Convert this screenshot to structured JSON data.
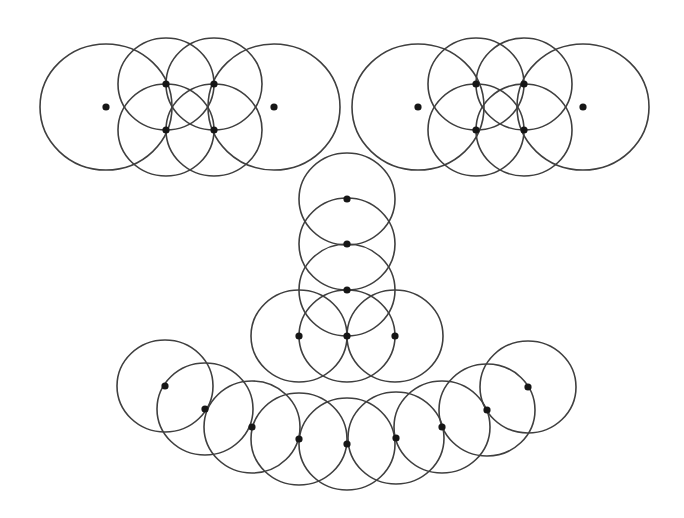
{
  "canvas": {
    "width": 684,
    "height": 518,
    "background": "#ffffff"
  },
  "style": {
    "stroke": "#3f3f3f",
    "dot_fill": "#161616",
    "dot_radius": 3.6
  },
  "groups": [
    {
      "name": "top-left-cluster",
      "circles": [
        {
          "cx": 106,
          "cy": 107,
          "rx": 66,
          "ry": 63,
          "dot": true
        },
        {
          "cx": 274,
          "cy": 107,
          "rx": 66,
          "ry": 63,
          "dot": true
        },
        {
          "cx": 166,
          "cy": 84,
          "rx": 48,
          "ry": 46,
          "dot": true
        },
        {
          "cx": 214,
          "cy": 84,
          "rx": 48,
          "ry": 46,
          "dot": true
        },
        {
          "cx": 166,
          "cy": 130,
          "rx": 48,
          "ry": 46,
          "dot": true
        },
        {
          "cx": 214,
          "cy": 130,
          "rx": 48,
          "ry": 46,
          "dot": true
        }
      ]
    },
    {
      "name": "top-right-cluster",
      "circles": [
        {
          "cx": 418,
          "cy": 107,
          "rx": 66,
          "ry": 63,
          "dot": true
        },
        {
          "cx": 583,
          "cy": 107,
          "rx": 66,
          "ry": 63,
          "dot": true
        },
        {
          "cx": 476,
          "cy": 84,
          "rx": 48,
          "ry": 46,
          "dot": true
        },
        {
          "cx": 524,
          "cy": 84,
          "rx": 48,
          "ry": 46,
          "dot": true
        },
        {
          "cx": 476,
          "cy": 130,
          "rx": 48,
          "ry": 46,
          "dot": true
        },
        {
          "cx": 524,
          "cy": 130,
          "rx": 48,
          "ry": 46,
          "dot": true
        }
      ]
    },
    {
      "name": "center-column",
      "circles": [
        {
          "cx": 347,
          "cy": 199,
          "rx": 48,
          "ry": 46,
          "dot": true
        },
        {
          "cx": 347,
          "cy": 244,
          "rx": 48,
          "ry": 46,
          "dot": true
        },
        {
          "cx": 347,
          "cy": 290,
          "rx": 48,
          "ry": 46,
          "dot": true
        },
        {
          "cx": 299,
          "cy": 336,
          "rx": 48,
          "ry": 46,
          "dot": true
        },
        {
          "cx": 347,
          "cy": 336,
          "rx": 48,
          "ry": 46,
          "dot": true
        },
        {
          "cx": 395,
          "cy": 336,
          "rx": 48,
          "ry": 46,
          "dot": true
        }
      ]
    },
    {
      "name": "bottom-arc",
      "circles": [
        {
          "cx": 165,
          "cy": 386,
          "rx": 48,
          "ry": 46,
          "dot": true
        },
        {
          "cx": 205,
          "cy": 409,
          "rx": 48,
          "ry": 46,
          "dot": true
        },
        {
          "cx": 252,
          "cy": 427,
          "rx": 48,
          "ry": 46,
          "dot": true
        },
        {
          "cx": 299,
          "cy": 439,
          "rx": 48,
          "ry": 46,
          "dot": true
        },
        {
          "cx": 347,
          "cy": 444,
          "rx": 48,
          "ry": 46,
          "dot": true
        },
        {
          "cx": 396,
          "cy": 438,
          "rx": 48,
          "ry": 46,
          "dot": true
        },
        {
          "cx": 442,
          "cy": 427,
          "rx": 48,
          "ry": 46,
          "dot": true
        },
        {
          "cx": 487,
          "cy": 410,
          "rx": 48,
          "ry": 46,
          "dot": true
        },
        {
          "cx": 528,
          "cy": 387,
          "rx": 48,
          "ry": 46,
          "dot": true
        }
      ]
    }
  ]
}
